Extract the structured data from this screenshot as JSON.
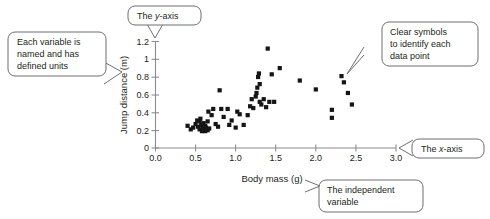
{
  "figure": {
    "kind": "scatter-plot-with-annotations"
  },
  "chart_data": {
    "type": "scatter",
    "title": "",
    "xlabel": "Body mass (g)",
    "ylabel": "Jump distance (m)",
    "xlim": [
      0.0,
      3.0
    ],
    "ylim": [
      0.0,
      1.2
    ],
    "grid": false,
    "legend": null,
    "xticks": [
      "0.0",
      "0.5",
      "1.0",
      "1.5",
      "2.0",
      "2.5",
      "3.0"
    ],
    "xtick_values": [
      0.0,
      0.5,
      1.0,
      1.5,
      2.0,
      2.5,
      3.0
    ],
    "yticks": [
      "0",
      "0.2",
      "0.4",
      "0.6",
      "0.8",
      "1",
      "1.2"
    ],
    "ytick_values": [
      0.0,
      0.2,
      0.4,
      0.6,
      0.8,
      1.0,
      1.2
    ],
    "marker": "square",
    "marker_color": "#151515",
    "series": [
      {
        "name": "jump distance vs body mass",
        "points": [
          [
            0.4,
            0.25
          ],
          [
            0.44,
            0.21
          ],
          [
            0.47,
            0.23
          ],
          [
            0.5,
            0.27
          ],
          [
            0.52,
            0.31
          ],
          [
            0.53,
            0.24
          ],
          [
            0.55,
            0.3
          ],
          [
            0.55,
            0.21
          ],
          [
            0.56,
            0.33
          ],
          [
            0.57,
            0.26
          ],
          [
            0.58,
            0.19
          ],
          [
            0.59,
            0.22
          ],
          [
            0.6,
            0.28
          ],
          [
            0.61,
            0.2
          ],
          [
            0.62,
            0.25
          ],
          [
            0.62,
            0.19
          ],
          [
            0.63,
            0.23
          ],
          [
            0.64,
            0.21
          ],
          [
            0.65,
            0.3
          ],
          [
            0.65,
            0.2
          ],
          [
            0.66,
            0.41
          ],
          [
            0.67,
            0.22
          ],
          [
            0.7,
            0.37
          ],
          [
            0.72,
            0.44
          ],
          [
            0.75,
            0.27
          ],
          [
            0.78,
            0.24
          ],
          [
            0.8,
            0.65
          ],
          [
            0.82,
            0.44
          ],
          [
            0.85,
            0.35
          ],
          [
            0.9,
            0.44
          ],
          [
            0.92,
            0.26
          ],
          [
            0.95,
            0.31
          ],
          [
            1.0,
            0.23
          ],
          [
            1.02,
            0.41
          ],
          [
            1.05,
            0.38
          ],
          [
            1.1,
            0.26
          ],
          [
            1.15,
            0.37
          ],
          [
            1.18,
            0.47
          ],
          [
            1.2,
            0.55
          ],
          [
            1.22,
            0.45
          ],
          [
            1.25,
            0.58
          ],
          [
            1.26,
            0.62
          ],
          [
            1.27,
            0.68
          ],
          [
            1.28,
            0.8
          ],
          [
            1.29,
            0.84
          ],
          [
            1.3,
            0.72
          ],
          [
            1.3,
            0.52
          ],
          [
            1.32,
            0.49
          ],
          [
            1.35,
            0.55
          ],
          [
            1.38,
            0.46
          ],
          [
            1.4,
            1.12
          ],
          [
            1.42,
            0.52
          ],
          [
            1.45,
            0.83
          ],
          [
            1.48,
            0.52
          ],
          [
            1.55,
            0.9
          ],
          [
            1.8,
            0.76
          ],
          [
            2.0,
            0.66
          ],
          [
            2.2,
            0.43
          ],
          [
            2.2,
            0.34
          ],
          [
            2.32,
            0.81
          ],
          [
            2.35,
            0.74
          ],
          [
            2.4,
            0.62
          ],
          [
            2.45,
            0.49
          ]
        ]
      }
    ]
  },
  "callouts": {
    "variables": {
      "lines": [
        "Each variable is",
        "named and has",
        "defined units"
      ]
    },
    "y_axis": {
      "prefix": "The ",
      "italic": "y",
      "suffix": "-axis"
    },
    "symbols": {
      "lines": [
        "Clear symbols",
        "to identify each",
        "data point"
      ]
    },
    "x_axis": {
      "prefix": "The ",
      "italic": "x",
      "suffix": "-axis"
    },
    "independent": {
      "lines": [
        "The independent",
        "variable"
      ]
    }
  },
  "colors": {
    "axis": "#8c8c8c",
    "marker": "#151515",
    "callout_border": "#6f6f6f",
    "text": "#231f20",
    "background": "#ffffff"
  }
}
